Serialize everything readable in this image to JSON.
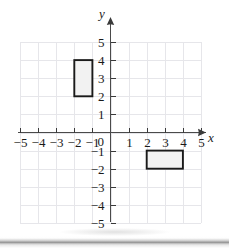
{
  "figure": {
    "name": "coordinate-grid-with-two-rectangles",
    "background_color": "#ffffff",
    "grid_color": "#e6e6ea",
    "axis_color": "#5a5a5a",
    "shape_stroke_color": "#1a1a1a",
    "shape_fill_color": "#f2f2f2"
  },
  "axes": {
    "x_label": "x",
    "y_label": "y",
    "origin_label": "0",
    "x_min": -5,
    "x_max": 5,
    "y_min": -5,
    "y_max": 5,
    "x_tick_labels": [
      "−5",
      "−4",
      "−3",
      "−2",
      "−1",
      "1",
      "2",
      "3",
      "4",
      "5"
    ],
    "x_tick_values": [
      -5,
      -4,
      -3,
      -2,
      -1,
      1,
      2,
      3,
      4,
      5
    ],
    "y_tick_labels": [
      "5",
      "4",
      "3",
      "2",
      "1",
      "−1",
      "−2",
      "−3",
      "−4",
      "−5"
    ],
    "y_tick_values": [
      5,
      4,
      3,
      2,
      1,
      -1,
      -2,
      -3,
      -4,
      -5
    ],
    "has_x_arrow": true,
    "has_y_arrow": true,
    "grid_visible": true
  },
  "chart_data": {
    "type": "scatter",
    "title": "",
    "xlabel": "x",
    "ylabel": "y",
    "xlim": [
      -5,
      5
    ],
    "ylim": [
      -5,
      5
    ],
    "grid": true,
    "legend": "none",
    "x_ticks": [
      -5,
      -4,
      -3,
      -2,
      -1,
      0,
      1,
      2,
      3,
      4,
      5
    ],
    "y_ticks": [
      -5,
      -4,
      -3,
      -2,
      -1,
      0,
      1,
      2,
      3,
      4,
      5
    ],
    "shapes": [
      {
        "name": "rectangle-upper-left",
        "type": "rectangle",
        "x_min": -2,
        "x_max": -1,
        "y_min": 2,
        "y_max": 4,
        "width": 1,
        "height": 2,
        "vertices": [
          [
            -2,
            2
          ],
          [
            -1,
            2
          ],
          [
            -1,
            4
          ],
          [
            -2,
            4
          ]
        ],
        "fill": "#f2f2f2",
        "stroke": "#1a1a1a"
      },
      {
        "name": "rectangle-lower-right",
        "type": "rectangle",
        "x_min": 2,
        "x_max": 4,
        "y_min": -2,
        "y_max": -1,
        "width": 2,
        "height": 1,
        "vertices": [
          [
            2,
            -2
          ],
          [
            4,
            -2
          ],
          [
            4,
            -1
          ],
          [
            2,
            -1
          ]
        ],
        "fill": "#f2f2f2",
        "stroke": "#1a1a1a"
      }
    ]
  }
}
